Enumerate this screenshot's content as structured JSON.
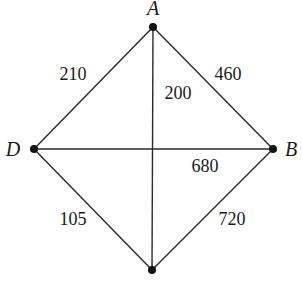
{
  "diagram": {
    "type": "weighted-graph",
    "nodes": [
      {
        "id": "A",
        "label": "A",
        "x": 153,
        "y": 27,
        "lx": 153,
        "ly": 15
      },
      {
        "id": "B",
        "label": "B",
        "x": 273,
        "y": 149,
        "lx": 291,
        "ly": 156
      },
      {
        "id": "C",
        "label": "",
        "x": 152,
        "y": 270,
        "lx": 152,
        "ly": 290
      },
      {
        "id": "D",
        "label": "D",
        "x": 34,
        "y": 149,
        "lx": 13,
        "ly": 156
      }
    ],
    "edges": [
      {
        "from": "A",
        "to": "D",
        "weight": "210",
        "lx": 73,
        "ly": 80
      },
      {
        "from": "A",
        "to": "C",
        "weight": "200",
        "lx": 178,
        "ly": 99
      },
      {
        "from": "A",
        "to": "B",
        "weight": "460",
        "lx": 228,
        "ly": 80
      },
      {
        "from": "D",
        "to": "B",
        "weight": "680",
        "lx": 205,
        "ly": 172
      },
      {
        "from": "D",
        "to": "C",
        "weight": "105",
        "lx": 73,
        "ly": 225
      },
      {
        "from": "B",
        "to": "C",
        "weight": "720",
        "lx": 232,
        "ly": 225
      }
    ]
  }
}
